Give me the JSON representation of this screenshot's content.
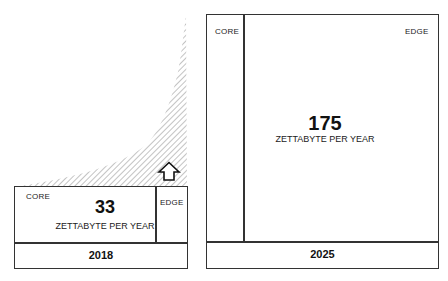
{
  "diagram": {
    "growth_arrow": "arrow-up-icon",
    "left": {
      "core_label": "CORE",
      "edge_label": "EDGE",
      "value": "33",
      "unit": "ZETTABYTE PER YEAR",
      "year": "2018"
    },
    "right": {
      "core_label": "CORE",
      "edge_label": "EDGE",
      "value": "175",
      "unit": "ZETTABYTE PER YEAR",
      "year": "2025"
    },
    "colors": {
      "border": "#333333",
      "hatch": "#9a9a9a"
    }
  }
}
